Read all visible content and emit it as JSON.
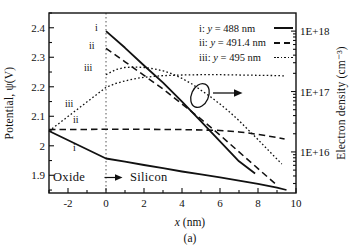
{
  "chart_data": {
    "type": "line",
    "caption": "(a)",
    "x_axis": {
      "label_var": "x",
      "label_rest": " (nm)",
      "range": [
        -3,
        10
      ],
      "major_ticks": [
        -2,
        0,
        2,
        4,
        6,
        8,
        10
      ],
      "tick_labels": [
        "-2",
        "0",
        "2",
        "4",
        "6",
        "8",
        "10"
      ],
      "minor_tick_step": 1
    },
    "y_left": {
      "label": "Potential, ψ(V)",
      "range": [
        1.84,
        2.45
      ],
      "major_ticks": [
        2.4,
        2.3,
        2.2,
        2.1,
        2.0,
        1.9
      ],
      "tick_labels": [
        "2.4",
        "2.3",
        "2.2",
        "2.1",
        "2",
        "1.9"
      ],
      "minor_tick_step": 0.05
    },
    "y_right": {
      "label": "Electron density (cm⁻³)",
      "scale": "log",
      "range_exp": [
        15.32,
        18.3
      ],
      "major_tick_exponents": [
        18,
        17,
        16
      ],
      "tick_labels": [
        "1E+18",
        "1E+17",
        "1E+16"
      ]
    },
    "boundary_x": 0,
    "legend": [
      {
        "prefix": "i: ",
        "var": "y",
        "rest": " = 488 nm",
        "linestyle": "solid"
      },
      {
        "prefix": "ii: ",
        "var": "y",
        "rest": " = 491.4 nm",
        "linestyle": "dashed"
      },
      {
        "prefix": "iii: ",
        "var": "y",
        "rest": " = 495 nm",
        "linestyle": "dotted"
      }
    ],
    "series": [
      {
        "id": "potential-i",
        "label": "i",
        "quantity": "potential",
        "axis": "left",
        "linestyle": "solid",
        "points": [
          [
            -3,
            2.05
          ],
          [
            0,
            1.957
          ],
          [
            1,
            1.946
          ],
          [
            2,
            1.935
          ],
          [
            3,
            1.924
          ],
          [
            4,
            1.913
          ],
          [
            5,
            1.903
          ],
          [
            6,
            1.893
          ],
          [
            7,
            1.882
          ],
          [
            8,
            1.871
          ],
          [
            9,
            1.858
          ],
          [
            9.5,
            1.85
          ]
        ]
      },
      {
        "id": "potential-ii",
        "label": "ii",
        "quantity": "potential",
        "axis": "left",
        "linestyle": "dashed",
        "points": [
          [
            -3,
            2.055
          ],
          [
            0,
            2.056
          ],
          [
            2,
            2.056
          ],
          [
            4,
            2.055
          ],
          [
            6,
            2.052
          ],
          [
            7,
            2.047
          ],
          [
            8,
            2.039
          ],
          [
            9,
            2.028
          ],
          [
            9.4,
            2.023
          ]
        ]
      },
      {
        "id": "potential-iii",
        "label": "iii",
        "quantity": "potential",
        "axis": "left",
        "linestyle": "dotted",
        "points": [
          [
            -3,
            2.05
          ],
          [
            0,
            2.198
          ],
          [
            0.5,
            2.211
          ],
          [
            1,
            2.22
          ],
          [
            1.5,
            2.227
          ],
          [
            2,
            2.232
          ],
          [
            3,
            2.238
          ],
          [
            4,
            2.24
          ],
          [
            5,
            2.241
          ],
          [
            6,
            2.241
          ],
          [
            7,
            2.24
          ],
          [
            8,
            2.239
          ],
          [
            9,
            2.238
          ],
          [
            9.4,
            2.237
          ]
        ]
      },
      {
        "id": "density-i",
        "label": "i",
        "quantity": "electron-density",
        "axis": "right",
        "linestyle": "solid",
        "points": [
          [
            0,
            1e+18
          ],
          [
            1,
            5.3e+17
          ],
          [
            2,
            2.7e+17
          ],
          [
            3,
            1.4e+17
          ],
          [
            4,
            6.8e+16
          ],
          [
            5,
            3.2e+16
          ],
          [
            6,
            1.5e+16
          ],
          [
            7,
            7000000000000000.0
          ],
          [
            7.85,
            4400000000000000.0
          ]
        ]
      },
      {
        "id": "density-ii",
        "label": "ii",
        "quantity": "electron-density",
        "axis": "right",
        "linestyle": "dashed",
        "points": [
          [
            0,
            5.2e+17
          ],
          [
            1,
            3.1e+17
          ],
          [
            2,
            1.85e+17
          ],
          [
            3,
            1.1e+17
          ],
          [
            4,
            6.2e+16
          ],
          [
            5,
            3.5e+16
          ],
          [
            6,
            1.9e+16
          ],
          [
            7,
            1e+16
          ],
          [
            8,
            5300000000000000.0
          ],
          [
            9,
            2800000000000000.0
          ]
        ]
      },
      {
        "id": "density-iii",
        "label": "iii",
        "quantity": "electron-density",
        "axis": "right",
        "linestyle": "dotted",
        "points": [
          [
            0,
            1.9e+17
          ],
          [
            0.5,
            2.3e+17
          ],
          [
            1,
            2.5e+17
          ],
          [
            1.5,
            2.55e+17
          ],
          [
            2,
            2.5e+17
          ],
          [
            2.5,
            2.38e+17
          ],
          [
            3,
            2.2e+17
          ],
          [
            3.5,
            1.95e+17
          ],
          [
            4,
            1.65e+17
          ],
          [
            4.5,
            1.35e+17
          ],
          [
            5,
            1.05e+17
          ],
          [
            5.5,
            8.2e+16
          ],
          [
            6,
            6.2e+16
          ],
          [
            6.5,
            4.6e+16
          ],
          [
            7,
            3.3e+16
          ],
          [
            7.5,
            2.3e+16
          ],
          [
            8,
            1.6e+16
          ],
          [
            8.5,
            1.1e+16
          ],
          [
            9,
            7600000000000000.0
          ],
          [
            9.25,
            6300000000000000.0
          ]
        ]
      }
    ],
    "curve_labels": {
      "density_i": "i",
      "density_ii": "ii",
      "density_iii": "iii",
      "potential_i": "i",
      "potential_ii": "ii",
      "potential_iii": "iii"
    },
    "region_labels": {
      "oxide": "Oxide",
      "silicon": "Silicon"
    },
    "axis_indicator": {
      "target_axis": "right"
    },
    "colors": {
      "ink": "#111111",
      "background": "#ffffff"
    }
  }
}
